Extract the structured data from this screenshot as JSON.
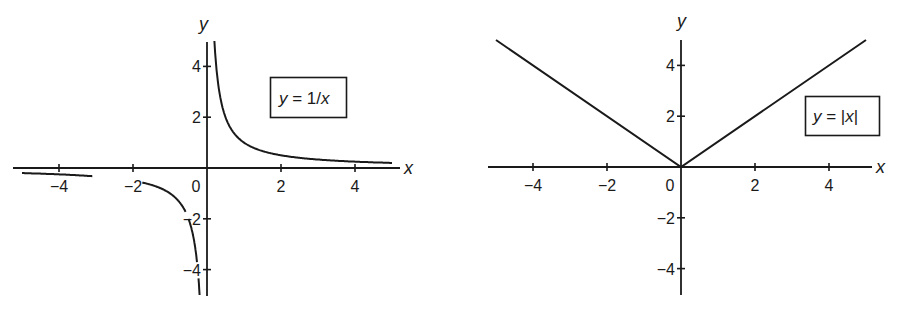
{
  "colors": {
    "ink": "#1a1a1a",
    "background": "#ffffff"
  },
  "chart_data": [
    {
      "type": "line",
      "title": "",
      "legend": "y = 1/x",
      "legend_parts": {
        "lhs": "y",
        "eq": " = 1/",
        "var": "x"
      },
      "xlabel": "x",
      "ylabel": "y",
      "xlim": [
        -5.2,
        5.2
      ],
      "ylim": [
        -5,
        5
      ],
      "x_ticks": [
        -4,
        -2,
        0,
        2,
        4
      ],
      "x_tick_labels": [
        "−4",
        "−2",
        "0",
        "2",
        "4"
      ],
      "y_ticks": [
        -4,
        -2,
        2,
        4
      ],
      "y_tick_labels": [
        "−4",
        "−2",
        "2",
        "4"
      ],
      "grid": false,
      "legend_position": "upper right (boxed)",
      "series": [
        {
          "name": "y = 1/x (x > 0)",
          "x": [
            0.2,
            0.25,
            0.3,
            0.4,
            0.5,
            0.75,
            1,
            1.5,
            2,
            3,
            4,
            5
          ],
          "y": [
            5,
            4,
            3.33,
            2.5,
            2,
            1.33,
            1,
            0.67,
            0.5,
            0.33,
            0.25,
            0.2
          ]
        },
        {
          "name": "y = 1/x (x < 0)",
          "x": [
            -5,
            -4,
            -3,
            -2,
            -1.5,
            -1,
            -0.75,
            -0.5,
            -0.4,
            -0.3,
            -0.25,
            -0.2
          ],
          "y": [
            -0.2,
            -0.25,
            -0.33,
            -0.5,
            -0.67,
            -1,
            -1.33,
            -2,
            -2.5,
            -3.33,
            -4,
            -5
          ]
        }
      ]
    },
    {
      "type": "line",
      "title": "",
      "legend": "y = |x|",
      "legend_parts": {
        "lhs": "y",
        "eq": " = |",
        "var": "x",
        "end": "|"
      },
      "xlabel": "x",
      "ylabel": "y",
      "xlim": [
        -5.2,
        5.2
      ],
      "ylim": [
        -5,
        5
      ],
      "x_ticks": [
        -4,
        -2,
        0,
        2,
        4
      ],
      "x_tick_labels": [
        "−4",
        "−2",
        "0",
        "2",
        "4"
      ],
      "y_ticks": [
        -4,
        -2,
        2,
        4
      ],
      "y_tick_labels": [
        "−4",
        "−2",
        "2",
        "4"
      ],
      "grid": false,
      "legend_position": "right (boxed)",
      "series": [
        {
          "name": "y = |x|",
          "x": [
            -5,
            0,
            5
          ],
          "y": [
            5,
            0,
            5
          ]
        }
      ]
    }
  ]
}
